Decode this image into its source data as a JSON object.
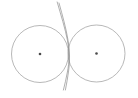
{
  "figure": {
    "background_color": "#ffffff",
    "width": 138,
    "height": 98,
    "stroke_color": "#9a9a9a",
    "curve_color": "#8e8e8e",
    "dot_color": "#4a4a4a",
    "stroke_width": 0.7
  },
  "chart_data": {
    "type": "scatter",
    "xlabel": "",
    "ylabel": "",
    "xlim": [
      0,
      138
    ],
    "ylim": [
      0,
      98
    ],
    "grid": false,
    "legend": "none",
    "shapes": [
      {
        "name": "left-circle",
        "kind": "circle",
        "cx": 40,
        "cy": 54,
        "r": 28.5,
        "stroke": "#9a9a9a",
        "fill": "none"
      },
      {
        "name": "right-circle",
        "kind": "circle",
        "cx": 96.5,
        "cy": 53.5,
        "r": 28.5,
        "stroke": "#9a9a9a",
        "fill": "none"
      },
      {
        "name": "crossing-arc",
        "kind": "path",
        "d": "M 57.2 2.0 C 61.0 15.5 65.2 28.5 67.5 40.5 C 69.6 51.5 69.4 62.0 67.4 72.0 C 66.2 78.5 64.8 84.5 63.4 90.0",
        "stroke": "#8e8e8e",
        "fill": "none"
      },
      {
        "name": "secondary-arc",
        "kind": "path",
        "d": "M 59.0 3.0 C 62.6 16.0 66.0 28.0 67.9 39.5 C 69.9 51.0 70.0 61.5 68.6 71.0 C 67.7 77.5 66.6 84.0 65.4 90.0",
        "stroke": "#8e8e8e",
        "fill": "none"
      }
    ],
    "points": [
      {
        "name": "left-circle-center",
        "x": 40,
        "y": 54,
        "marker": "dot",
        "size": 1.3,
        "color": "#4a4a4a"
      },
      {
        "name": "right-circle-center",
        "x": 96.5,
        "y": 53.5,
        "marker": "dot",
        "size": 1.3,
        "color": "#4a4a4a"
      }
    ]
  },
  "elements": {
    "left_circle": {
      "label": "left-circle",
      "cx": 40,
      "cy": 54,
      "r": 28.5
    },
    "right_circle": {
      "label": "right-circle",
      "cx": 96.5,
      "cy": 53.5,
      "r": 28.5
    },
    "left_center_dot": {
      "label": "left-circle-center",
      "cx": 40,
      "cy": 54,
      "r": 1.3
    },
    "right_center_dot": {
      "label": "right-circle-center",
      "cx": 96.5,
      "cy": 53.5,
      "r": 1.3
    },
    "arc_primary": {
      "label": "crossing-arc",
      "d": "M 57.2 2.0 C 61.0 15.5 65.2 28.5 67.5 40.5 C 69.6 51.5 69.4 62.0 67.4 72.0 C 66.2 78.5 64.8 84.5 63.4 90.0"
    },
    "arc_secondary": {
      "label": "secondary-arc",
      "d": "M 59.0 3.0 C 62.6 16.0 66.0 28.0 67.9 39.5 C 69.9 51.0 70.0 61.5 68.6 71.0 C 67.7 77.5 66.6 84.0 65.4 90.0"
    }
  }
}
